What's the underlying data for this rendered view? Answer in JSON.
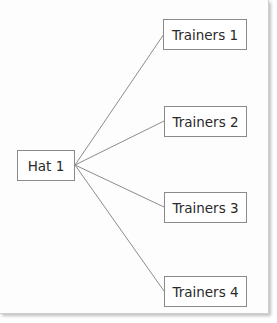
{
  "diagram": {
    "root": {
      "label": "Hat 1"
    },
    "children": [
      {
        "label": "Trainers 1"
      },
      {
        "label": "Trainers 2"
      },
      {
        "label": "Trainers 3"
      },
      {
        "label": "Trainers 4"
      }
    ],
    "line_color": "#8c8c8c"
  }
}
